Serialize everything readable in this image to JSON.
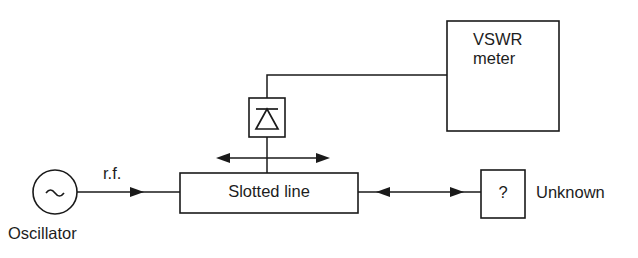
{
  "diagram": {
    "background_color": "#ffffff",
    "line_color": "#1a1a1a",
    "blocks": {
      "vswr_meter": {
        "label_line1": "VSWR",
        "label_line2": "meter",
        "shape": "rectangle",
        "x": 447,
        "y": 21,
        "width": 112,
        "height": 110
      },
      "detector": {
        "label": "",
        "icon": "diode-icon",
        "shape": "rectangle",
        "x": 249,
        "y": 98,
        "width": 36,
        "height": 39
      },
      "slotted_line": {
        "label": "Slotted line",
        "shape": "rectangle",
        "x": 180,
        "y": 173,
        "width": 178,
        "height": 40
      },
      "unknown_load": {
        "label": "?",
        "shape": "rectangle",
        "x": 481,
        "y": 170,
        "width": 44,
        "height": 48
      },
      "oscillator": {
        "label": "Oscillator",
        "symbol": "~",
        "shape": "circle",
        "cx": 55,
        "cy": 192,
        "r": 22
      }
    },
    "labels": {
      "rf": "r.f.",
      "unknown": "Unknown",
      "oscillator": "Oscillator",
      "vswr_line1": "VSWR",
      "vswr_line2": "meter",
      "slotted_line": "Slotted line",
      "question_mark": "?"
    },
    "connections": [
      {
        "name": "oscillator-to-slotted-line",
        "from": "oscillator",
        "to": "slotted_line",
        "arrow": "single-right",
        "signal_label": "r.f."
      },
      {
        "name": "detector-to-vswr-meter",
        "from": "detector",
        "to": "vswr_meter",
        "arrow": "none"
      },
      {
        "name": "detector-probe-to-slotted-line",
        "from": "detector",
        "to": "slotted_line",
        "arrow": "none"
      },
      {
        "name": "probe-travel",
        "from": "slotted_line",
        "to": "slotted_line",
        "arrow": "double-horizontal"
      },
      {
        "name": "slotted-line-to-unknown",
        "from": "slotted_line",
        "to": "unknown_load",
        "arrow": "double-horizontal"
      }
    ]
  }
}
